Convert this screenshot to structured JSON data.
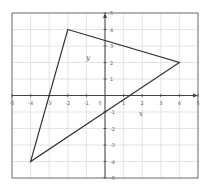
{
  "chart_data": {
    "type": "line",
    "title": "",
    "xlabel": "x",
    "ylabel": "y",
    "xlim": [
      -5,
      5
    ],
    "ylim": [
      -5,
      5
    ],
    "grid": true,
    "x_ticks": [
      -5,
      -4,
      -3,
      -2,
      -1,
      0,
      1,
      2,
      3,
      4,
      5
    ],
    "y_ticks": [
      -5,
      -4,
      -3,
      -2,
      -1,
      1,
      2,
      3,
      4,
      5
    ],
    "x_tick_labels": [
      "-5",
      "-4",
      "-3",
      "-2",
      "-1",
      "0",
      "1",
      "2",
      "3",
      "4",
      "5"
    ],
    "y_tick_labels": [
      "-5",
      "-4",
      "-3",
      "-2",
      "-1",
      "1",
      "2",
      "3",
      "4",
      "5"
    ],
    "series": [
      {
        "name": "triangle",
        "closed": true,
        "points": [
          {
            "x": -2,
            "y": 4
          },
          {
            "x": 4,
            "y": 2
          },
          {
            "x": -4,
            "y": -4
          }
        ]
      }
    ]
  },
  "colors": {
    "grid": "#dddddd",
    "frame": "#777777",
    "axis": "#444444",
    "shape": "#333333"
  }
}
